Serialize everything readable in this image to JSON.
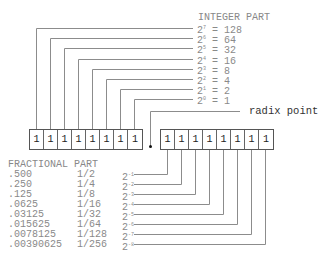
{
  "integer_part": {
    "heading": "INTEGER PART",
    "powers": [
      {
        "base": "2",
        "exp": "7",
        "eq": " = 128"
      },
      {
        "base": "2",
        "exp": "6",
        "eq": " = 64"
      },
      {
        "base": "2",
        "exp": "5",
        "eq": " = 32"
      },
      {
        "base": "2",
        "exp": "4",
        "eq": " = 16"
      },
      {
        "base": "2",
        "exp": "3",
        "eq": " = 8"
      },
      {
        "base": "2",
        "exp": "2",
        "eq": " = 4"
      },
      {
        "base": "2",
        "exp": "1",
        "eq": " = 2"
      },
      {
        "base": "2",
        "exp": "0",
        "eq": " = 1"
      }
    ],
    "bits": [
      "1",
      "1",
      "1",
      "1",
      "1",
      "1",
      "1",
      "1"
    ]
  },
  "radix_point": {
    "label": "radix point"
  },
  "fractional_part": {
    "heading": "FRACTIONAL PART",
    "bits": [
      "1",
      "1",
      "1",
      "1",
      "1",
      "1",
      "1",
      "1"
    ],
    "rows": [
      {
        "decimal": ".500",
        "fraction": "1/2",
        "base": "2",
        "exp": "-1"
      },
      {
        "decimal": ".250",
        "fraction": "1/4",
        "base": "2",
        "exp": "-2"
      },
      {
        "decimal": ".125",
        "fraction": "1/8",
        "base": "2",
        "exp": "-3"
      },
      {
        "decimal": ".0625",
        "fraction": "1/16",
        "base": "2",
        "exp": "-4"
      },
      {
        "decimal": ".03125",
        "fraction": "1/32",
        "base": "2",
        "exp": "-5"
      },
      {
        "decimal": ".015625",
        "fraction": "1/64",
        "base": "2",
        "exp": "-6"
      },
      {
        "decimal": ".0078125",
        "fraction": "1/128",
        "base": "2",
        "exp": "-7"
      },
      {
        "decimal": ".00390625",
        "fraction": "1/256",
        "base": "2",
        "exp": "-8"
      }
    ]
  },
  "colors": {
    "line": "#8c8c8c",
    "text": "#8a8a8a",
    "box_border": "#555555"
  }
}
